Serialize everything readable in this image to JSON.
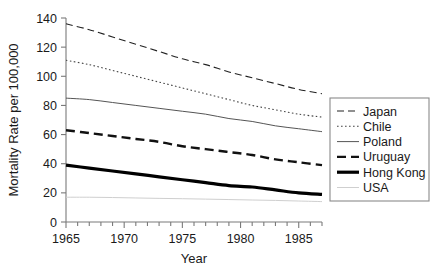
{
  "chart_data": {
    "type": "line",
    "title": "",
    "xlabel": "Year",
    "ylabel": "Mortality Rate per 100,000",
    "xlim": [
      1965,
      1987
    ],
    "ylim": [
      0,
      140
    ],
    "grid": false,
    "legend_position": "right",
    "x_ticks": [
      1965,
      1970,
      1975,
      1980,
      1985
    ],
    "x_tick_labels": [
      "1965",
      "1970",
      "1975",
      "1980",
      "1985"
    ],
    "x_minor_ticks": [
      1965,
      1966,
      1967,
      1968,
      1969,
      1970,
      1971,
      1972,
      1973,
      1974,
      1975,
      1976,
      1977,
      1978,
      1979,
      1980,
      1981,
      1982,
      1983,
      1984,
      1985,
      1986,
      1987
    ],
    "y_ticks": [
      0,
      20,
      40,
      60,
      80,
      100,
      120,
      140
    ],
    "y_tick_labels": [
      "0",
      "20",
      "40",
      "60",
      "80",
      "100",
      "120",
      "140"
    ],
    "x": [
      1965,
      1967,
      1969,
      1971,
      1973,
      1975,
      1977,
      1979,
      1981,
      1983,
      1985,
      1987
    ],
    "series": [
      {
        "name": "Japan",
        "style": "dashed",
        "color": "#222222",
        "width": 1.1,
        "values": [
          136,
          132,
          127,
          122,
          117,
          112,
          108,
          103,
          99,
          95,
          91,
          88
        ]
      },
      {
        "name": "Chile",
        "style": "dotted",
        "color": "#444444",
        "width": 1.1,
        "values": [
          111,
          108,
          104,
          100,
          96,
          92,
          88,
          84,
          80,
          77,
          74,
          72
        ]
      },
      {
        "name": "Poland",
        "style": "solid",
        "color": "#555555",
        "width": 1.0,
        "values": [
          85,
          84,
          82,
          80,
          78,
          76,
          74,
          71,
          69,
          66,
          64,
          62
        ]
      },
      {
        "name": "Uruguay",
        "style": "dashed-bold",
        "color": "#111111",
        "width": 2.4,
        "values": [
          63,
          61,
          59,
          57,
          55,
          52,
          50,
          48,
          46,
          43,
          41,
          39
        ]
      },
      {
        "name": "Hong Kong",
        "style": "solid-bold",
        "color": "#000000",
        "width": 3.2,
        "values": [
          39,
          37,
          35,
          33,
          31,
          29,
          27,
          25,
          24,
          22,
          20,
          19
        ]
      },
      {
        "name": "USA",
        "style": "solid-faint",
        "color": "#cfcfcf",
        "width": 1.0,
        "values": [
          17,
          17,
          16.8,
          16.5,
          16.2,
          16,
          15.7,
          15.4,
          15.1,
          14.8,
          14.4,
          14
        ]
      }
    ]
  },
  "legend": {
    "entries": [
      {
        "label": "Japan"
      },
      {
        "label": "Chile"
      },
      {
        "label": "Poland"
      },
      {
        "label": "Uruguay"
      },
      {
        "label": "Hong Kong"
      },
      {
        "label": "USA"
      }
    ]
  }
}
